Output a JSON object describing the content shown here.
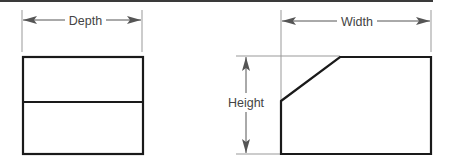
{
  "diagram": {
    "type": "orthographic-dimensioned-views",
    "colors": {
      "outline": "#1a1a1a",
      "dimension_line": "#555555",
      "extension_line": "#999999",
      "label": "#444444",
      "top_border": "#3a3a3a"
    },
    "views": [
      {
        "name": "side-view",
        "shape": "rectangle with horizontal divider",
        "dimension": {
          "label": "Depth",
          "orientation": "horizontal"
        }
      },
      {
        "name": "front-view",
        "shape": "rectangle with chamfered top-left corner",
        "dimensions": [
          {
            "label": "Width",
            "orientation": "horizontal"
          },
          {
            "label": "Height",
            "orientation": "vertical"
          }
        ]
      }
    ]
  },
  "labels": {
    "depth": "Depth",
    "width": "Width",
    "height": "Height"
  }
}
